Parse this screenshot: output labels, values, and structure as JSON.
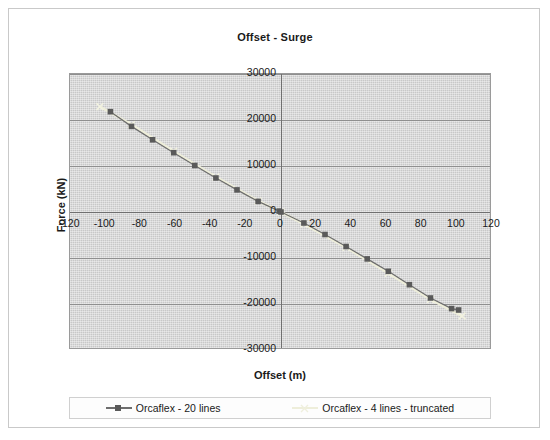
{
  "chart_data": {
    "type": "scatter",
    "title": "Offset - Surge",
    "xlabel": "Offset (m)",
    "ylabel": "Force (kN)",
    "xlim": [
      -120,
      120
    ],
    "ylim": [
      -30000,
      30000
    ],
    "xticks": [
      -120,
      -100,
      -80,
      -60,
      -40,
      -20,
      0,
      20,
      40,
      60,
      80,
      100,
      120
    ],
    "yticks": [
      30000,
      20000,
      10000,
      0,
      -10000,
      -20000,
      -30000
    ],
    "xtick_labels": [
      "-120",
      "-100",
      "-80",
      "-60",
      "-40",
      "-20",
      "0",
      "20",
      "40",
      "60",
      "80",
      "100",
      "120"
    ],
    "ytick_labels": [
      "30000",
      "20000",
      "10000",
      "0",
      "-10000",
      "-20000",
      "-30000"
    ],
    "grid": true,
    "legend_position": "bottom",
    "series": [
      {
        "name": "Orcaflex - 20 lines",
        "color": "#6e6e6e",
        "marker": "square",
        "marker_color": "#5a5a5a",
        "x": [
          -97,
          -85,
          -73,
          -61,
          -49,
          -37,
          -25,
          -13,
          -1,
          0,
          13,
          25,
          37,
          49,
          61,
          73,
          85,
          97,
          101
        ],
        "y": [
          21800,
          18600,
          15700,
          12900,
          10100,
          7400,
          4800,
          2300,
          200,
          0,
          -2400,
          -4900,
          -7500,
          -10200,
          -12900,
          -15800,
          -18700,
          -21000,
          -21300
        ]
      },
      {
        "name": "Orcaflex - 4 lines - truncated",
        "color": "#eeeeda",
        "marker": "x",
        "marker_color": "#f2f2e0",
        "x": [
          -103,
          -85,
          -61,
          -37,
          -13,
          0,
          13,
          37,
          61,
          85,
          103
        ],
        "y": [
          22900,
          19000,
          13200,
          7600,
          2400,
          0,
          -2600,
          -7700,
          -13300,
          -19000,
          -22600
        ]
      }
    ]
  },
  "legend": {
    "entries": [
      {
        "label": "Orcaflex - 20 lines"
      },
      {
        "label": "Orcaflex - 4 lines - truncated"
      }
    ]
  },
  "colors": {
    "plot_background": "#c8c8c8",
    "grid": "#8f8f8f",
    "axis": "#707070",
    "series1": "#6e6e6e",
    "series2": "#eeeeda",
    "text": "#1a1a1a",
    "frame": "#c9c9c9"
  }
}
